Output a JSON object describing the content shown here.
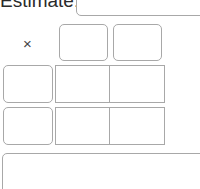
{
  "header": {
    "label": "Estimate:",
    "input_value": ""
  },
  "multiply": {
    "operator_symbol": "×",
    "top_inputs": [
      "",
      ""
    ],
    "left_inputs": [
      "",
      ""
    ],
    "grid": [
      [
        "",
        ""
      ],
      [
        "",
        ""
      ]
    ]
  },
  "answer": {
    "value": ""
  }
}
